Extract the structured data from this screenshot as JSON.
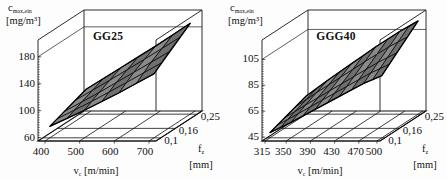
{
  "figure": {
    "background": "#fdfdfd",
    "surface_color": "#8a8a8a",
    "surface_color_dark": "#6f6f6f",
    "line_color": "#101010"
  },
  "chart_data": [
    {
      "type": "surface",
      "id": "gg25",
      "title": "GG25",
      "zlabel_symbol": "c",
      "zlabel_sub": "max,ein",
      "zlabel_unit": "[mg/m³]",
      "xlabel_symbol": "v",
      "xlabel_sub": "c",
      "xlabel_unit": "[m/min]",
      "ylabel_symbol": "f",
      "ylabel_sub": "z",
      "ylabel_unit": "[mm]",
      "xticks": [
        "400",
        "500",
        "600",
        "700"
      ],
      "x": [
        400,
        500,
        600,
        700
      ],
      "xlim": [
        380,
        720
      ],
      "yticks": [
        "0,1",
        "0,16",
        "0,25"
      ],
      "y": [
        0.1,
        0.16,
        0.25
      ],
      "ylim": [
        0.08,
        0.27
      ],
      "zticks": [
        "60",
        "100",
        "140",
        "180"
      ],
      "z": [
        60,
        100,
        140,
        180
      ],
      "zlim": [
        55,
        205
      ],
      "grid": true,
      "legend": "none",
      "series": [
        {
          "name": "c_max,ein",
          "y_at": 0.1,
          "values": [
            72,
            96,
            122,
            150
          ]
        },
        {
          "name": "c_max,ein",
          "y_at": 0.16,
          "values": [
            80,
            108,
            138,
            168
          ]
        },
        {
          "name": "c_max,ein",
          "y_at": 0.25,
          "values": [
            92,
            124,
            156,
            190
          ]
        }
      ]
    },
    {
      "type": "surface",
      "id": "ggg40",
      "title": "GGG40",
      "zlabel_symbol": "c",
      "zlabel_sub": "max,ein",
      "zlabel_unit": "[mg/m³]",
      "xlabel_symbol": "v",
      "xlabel_sub": "c",
      "xlabel_unit": "[m/min]",
      "ylabel_symbol": "f",
      "ylabel_sub": "z",
      "ylabel_unit": "[mm]",
      "xticks": [
        "315",
        "350",
        "390",
        "430",
        "470",
        "500"
      ],
      "x": [
        315,
        350,
        390,
        430,
        470,
        500
      ],
      "xlim": [
        310,
        505
      ],
      "yticks": [
        "0,1",
        "0,16",
        "0,25"
      ],
      "y": [
        0.1,
        0.16,
        0.25
      ],
      "ylim": [
        0.08,
        0.27
      ],
      "zticks": [
        "45",
        "65",
        "85",
        "105"
      ],
      "z": [
        45,
        65,
        85,
        105
      ],
      "zlim": [
        42,
        120
      ],
      "grid": true,
      "legend": "none",
      "series": [
        {
          "name": "c_max,ein",
          "y_at": 0.1,
          "values": [
            46,
            54,
            64,
            74,
            84,
            90
          ]
        },
        {
          "name": "c_max,ein",
          "y_at": 0.16,
          "values": [
            50,
            60,
            71,
            82,
            93,
            100
          ]
        },
        {
          "name": "c_max,ein",
          "y_at": 0.25,
          "values": [
            56,
            68,
            81,
            94,
            106,
            114
          ]
        }
      ]
    }
  ]
}
